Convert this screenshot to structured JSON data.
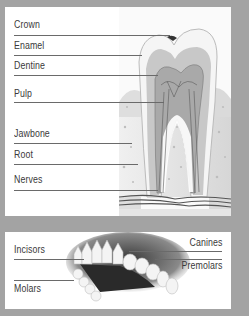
{
  "tooth_anatomy": {
    "labels": [
      {
        "text": "Crown",
        "y": 21,
        "line_y": 28,
        "line_end": 116
      },
      {
        "text": "Enamel",
        "y": 40,
        "line_y": 48,
        "line_end": 137
      },
      {
        "text": "Dentine",
        "y": 61,
        "line_y": 68,
        "line_end": 148
      },
      {
        "text": "Pulp",
        "y": 88,
        "line_y": 95,
        "line_end": 155
      },
      {
        "text": "Jawbone",
        "y": 129,
        "line_y": 136,
        "line_end": 122
      },
      {
        "text": "Root",
        "y": 150,
        "line_y": 157,
        "line_end": 128
      },
      {
        "text": "Nerves",
        "y": 175,
        "line_y": 183,
        "line_end": 148
      }
    ]
  },
  "teeth_types": {
    "left_labels": [
      {
        "text": "Incisors",
        "y": 18
      },
      {
        "text": "Molars",
        "y": 53
      }
    ],
    "right_labels": [
      {
        "text": "Canines",
        "y": 9
      },
      {
        "text": "Premolars",
        "y": 32
      }
    ]
  },
  "colors": {
    "frame": "#a3a3a3",
    "panel": "#ffffff",
    "text": "#3a3a3a",
    "leader_line": "#6a6a6a",
    "bone": "#dcdcdc",
    "dentine": "#c9c9c9",
    "enamel": "#f4f4f4"
  }
}
